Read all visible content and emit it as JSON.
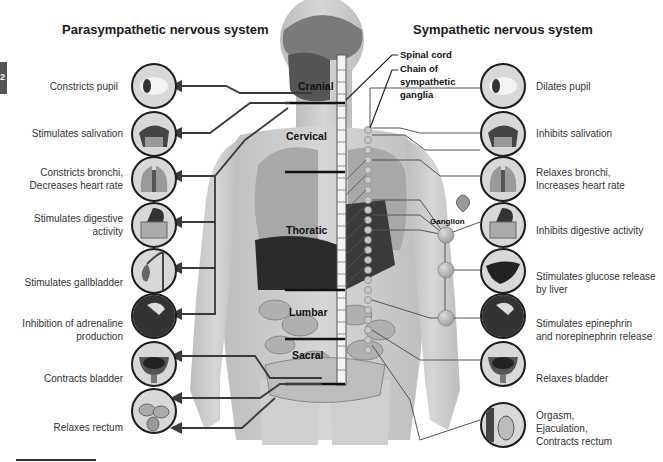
{
  "titles": {
    "parasympathetic": "Parasympathetic nervous system",
    "sympathetic": "Sympathetic nervous system"
  },
  "edge_tab": {
    "glyph": "2"
  },
  "spine_labels": {
    "spinal_cord": "Spinal cord",
    "chain_line1": "Chain of",
    "chain_line2": "sympathetic",
    "chain_line3": "ganglia",
    "ganglion": "Ganglion"
  },
  "regions": {
    "cranial": "Cranial",
    "cervical": "Cervical",
    "thoracic": "Thoratic",
    "lumbar": "Lumbar",
    "sacral": "Sacral"
  },
  "parasympathetic": {
    "items": [
      {
        "icon": "eye-icon",
        "lines": [
          "Constricts pupil"
        ]
      },
      {
        "icon": "salivary-gland-icon",
        "lines": [
          "Stimulates salivation"
        ]
      },
      {
        "icon": "lungs-heart-icon",
        "lines": [
          "Constricts bronchi,",
          "Decreases heart rate"
        ]
      },
      {
        "icon": "digestive-tract-icon",
        "lines": [
          "Stimulates digestive",
          "activity"
        ]
      },
      {
        "icon": "gallbladder-icon",
        "lines": [
          "Stimulates gallbladder"
        ]
      },
      {
        "icon": "adrenal-gland-icon",
        "lines": [
          "Inhibition of adrenaline",
          "production"
        ]
      },
      {
        "icon": "bladder-icon",
        "lines": [
          "Contracts bladder"
        ]
      },
      {
        "icon": "rectum-icon",
        "lines": [
          "Relaxes rectum"
        ]
      }
    ]
  },
  "sympathetic": {
    "items": [
      {
        "icon": "eye-icon",
        "lines": [
          "Dilates pupil"
        ]
      },
      {
        "icon": "salivary-gland-icon",
        "lines": [
          "Inhibits salivation"
        ]
      },
      {
        "icon": "lungs-heart-icon",
        "lines": [
          "Relaxes bronchi,",
          "Increases heart rate"
        ]
      },
      {
        "icon": "digestive-tract-icon",
        "lines": [
          "Inhibits digestive activity"
        ]
      },
      {
        "icon": "liver-icon",
        "lines": [
          "Stimulates glucose release",
          "by liver"
        ]
      },
      {
        "icon": "adrenal-gland-icon",
        "lines": [
          "Stimulates epinephrin",
          "and norepinephrin release"
        ]
      },
      {
        "icon": "bladder-icon",
        "lines": [
          "Relaxes bladder"
        ]
      },
      {
        "icon": "reproductive-organ-icon",
        "lines": [
          "Orgasm,",
          "Ejaculation,",
          "Contracts rectum"
        ]
      }
    ]
  },
  "colors": {
    "body_fill": "#c9c9c9",
    "organ_dark": "#2b2b2b",
    "line": "#3a3a3a",
    "ganglion_fill": "#b5b5b5"
  }
}
